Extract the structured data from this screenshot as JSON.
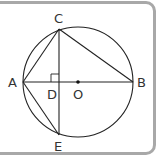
{
  "diagram": {
    "type": "geometry",
    "points": {
      "A": {
        "label": "A",
        "x": 23,
        "y": 82
      },
      "B": {
        "label": "B",
        "x": 133,
        "y": 82
      },
      "C": {
        "label": "C",
        "x": 59,
        "y": 29
      },
      "D": {
        "label": "D",
        "x": 59,
        "y": 82
      },
      "E": {
        "label": "E",
        "x": 59,
        "y": 135
      },
      "O": {
        "label": "O",
        "x": 78,
        "y": 82
      }
    },
    "circle": {
      "center": "O",
      "radius": 55
    },
    "segments": [
      "AB",
      "CE",
      "AC",
      "CB",
      "AE"
    ],
    "right_angle_marker": "D",
    "colors": {
      "stroke": "#222222",
      "label": "#333333",
      "frame": "#a8a8a8"
    }
  }
}
